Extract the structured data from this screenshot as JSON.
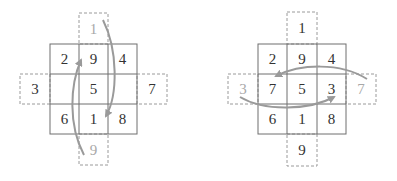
{
  "colors": {
    "grid_line": "#6e6e6e",
    "dashed_line": "#9a9a9a",
    "arrow": "#9a9a9a",
    "text": "#333333",
    "ghost_text": "#a8a8a8"
  },
  "left_diagram": {
    "grid": [
      [
        "2",
        "9",
        "4"
      ],
      [
        "",
        "5",
        ""
      ],
      [
        "6",
        "1",
        "8"
      ]
    ],
    "outside": {
      "top": "1",
      "left": "3",
      "right": "7",
      "bottom": "9"
    },
    "ghost": [
      "top",
      "bottom"
    ],
    "arrows": [
      "top-to-bottom-center",
      "bottom-to-top-center"
    ]
  },
  "right_diagram": {
    "grid": [
      [
        "2",
        "9",
        "4"
      ],
      [
        "7",
        "5",
        "3"
      ],
      [
        "6",
        "1",
        "8"
      ]
    ],
    "outside": {
      "top": "1",
      "left": "3",
      "right": "7",
      "bottom": "9"
    },
    "ghost": [
      "left",
      "right"
    ],
    "arrows": [
      "right-to-left-middle",
      "left-to-right-middle"
    ]
  }
}
